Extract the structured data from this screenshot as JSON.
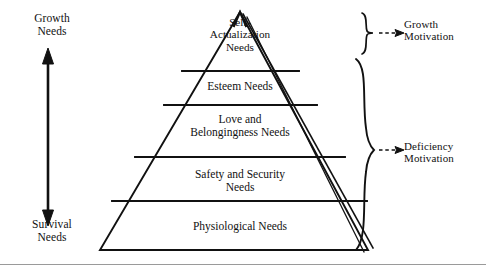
{
  "figure": {
    "ink_color": "#111111",
    "background_color": "#ffffff",
    "rule_color": "#9a9a9a"
  },
  "left_axis": {
    "top_label": "Growth\nNeeds",
    "bottom_label": "Survival\nNeeds",
    "arrow": "double-headed-vertical-arrow"
  },
  "pyramid": {
    "tiers": [
      {
        "index": 0,
        "label": "Self-\nActualization\nNeeds"
      },
      {
        "index": 1,
        "label": "Esteem Needs"
      },
      {
        "index": 2,
        "label": "Love and\nBelongingness Needs"
      },
      {
        "index": 3,
        "label": "Safety and Security\nNeeds"
      },
      {
        "index": 4,
        "label": "Physiological Needs"
      }
    ]
  },
  "right_annotations": [
    {
      "index": 0,
      "brace": "curly-brace-right",
      "arrow": "dashed-arrow-right",
      "label": "Growth\nMotivation"
    },
    {
      "index": 1,
      "brace": "curly-brace-right",
      "arrow": "dashed-arrow-right",
      "label": "Deficiency\nMotivation"
    }
  ]
}
